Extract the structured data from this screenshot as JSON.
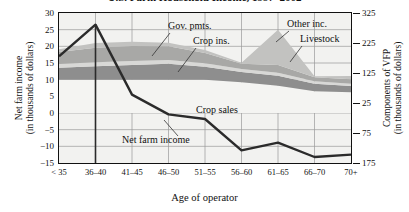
{
  "title": "U.S. Farm Household Income, 1997–2002",
  "axes": {
    "left_title_line1": "Net farm income",
    "left_title_line2": "(in thousands of dollars)",
    "right_title_line1": "Components of VFP",
    "right_title_line2": "(in thousands of dollars)",
    "x_title": "Age of operator",
    "left_ticks": [
      "30",
      "25",
      "20",
      "15",
      "10",
      "5",
      "0",
      "−5",
      "−10",
      "−15"
    ],
    "left_values": [
      30,
      25,
      20,
      15,
      10,
      5,
      0,
      -5,
      -10,
      -15
    ],
    "right_ticks": [
      "325",
      "225",
      "125",
      "25",
      "75",
      "175"
    ],
    "right_values": [
      325,
      225,
      125,
      25,
      75,
      175
    ],
    "x_ticks": [
      "< 35",
      "36–40",
      "41–45",
      "46–50",
      "51–55",
      "56–60",
      "61–65",
      "66–70",
      "70+"
    ]
  },
  "annotations": [
    {
      "name": "gov-pmts",
      "label": "Gov. pmts."
    },
    {
      "name": "crop-ins",
      "label": "Crop ins."
    },
    {
      "name": "other-inc",
      "label": "Other inc."
    },
    {
      "name": "livestock",
      "label": "Livestock"
    },
    {
      "name": "crop-sales",
      "label": "Crop sales"
    },
    {
      "name": "net-farm-income",
      "label": "Net farm income"
    }
  ],
  "colors": {
    "plot_background": "#f2f2f0",
    "axis": "#111111",
    "grid": "#9a9a9a",
    "crop_sales": "#f4f4f2",
    "livestock": "#8e8e8e",
    "crop_ins": "#d8d8d6",
    "gov_pmts": "#a8a8a6",
    "other_inc": "#c2c2c0",
    "net_farm_income_line": "#2b2b2b"
  },
  "chart_data": {
    "type": "area",
    "title": "U.S. Farm Household Income, 1997–2002",
    "xlabel": "Age of operator",
    "ylabel": "Net farm income (in thousands of dollars)",
    "y2label": "Components of VFP (in thousands of dollars)",
    "categories": [
      "< 35",
      "36–40",
      "41–45",
      "46–50",
      "51–55",
      "56–60",
      "61–65",
      "66–70",
      "70+"
    ],
    "ylim": [
      -15,
      30
    ],
    "y2lim": [
      -175,
      325
    ],
    "grid": true,
    "legend": "annotated-inline",
    "stacked_series": [
      {
        "name": "Crop sales",
        "values": [
          10.0,
          10.0,
          10.0,
          10.0,
          10.0,
          9.2,
          8.2,
          6.5,
          6.2
        ]
      },
      {
        "name": "Livestock",
        "values": [
          3.6,
          4.0,
          4.4,
          4.8,
          3.9,
          3.1,
          3.0,
          2.3,
          1.9
        ]
      },
      {
        "name": "Crop ins.",
        "values": [
          1.1,
          1.2,
          1.2,
          1.1,
          1.0,
          0.9,
          0.9,
          0.7,
          0.7
        ]
      },
      {
        "name": "Gov. pmts.",
        "values": [
          3.6,
          4.4,
          4.5,
          4.1,
          3.1,
          1.6,
          2.3,
          1.2,
          1.3
        ]
      },
      {
        "name": "Other inc.",
        "values": [
          0.8,
          1.4,
          1.3,
          1.1,
          0.9,
          0.3,
          10.6,
          0.3,
          1.0
        ]
      }
    ],
    "stacked_tops": [
      19.1,
      21.0,
      21.4,
      21.1,
      18.9,
      15.1,
      25.0,
      11.0,
      11.1
    ],
    "line_series": {
      "name": "Net farm income",
      "values": [
        17.0,
        26.5,
        5.5,
        -0.4,
        -1.8,
        -11.2,
        -8.9,
        -13.2,
        -12.5
      ]
    }
  }
}
